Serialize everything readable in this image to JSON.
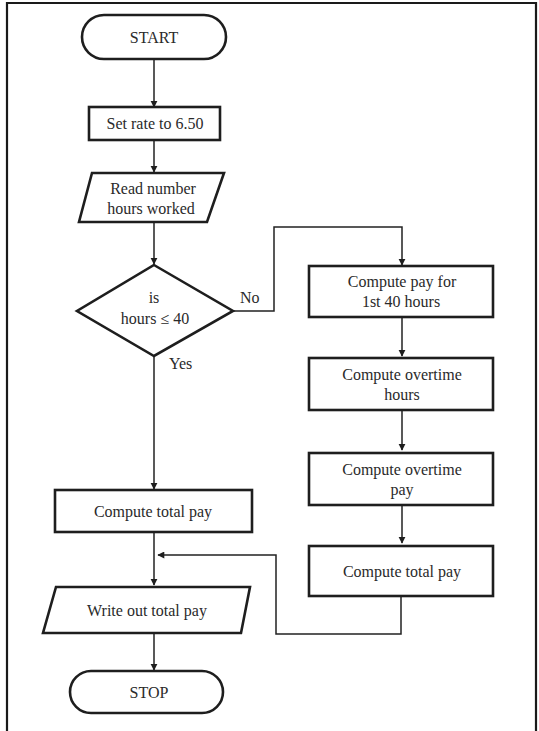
{
  "diagram": {
    "type": "flowchart",
    "colors": {
      "stroke": "#1e1e1e",
      "text": "#2a2a2a",
      "background": "#ffffff"
    },
    "nodes": [
      {
        "id": "start",
        "shape": "terminal",
        "lines": [
          "START"
        ]
      },
      {
        "id": "set_rate",
        "shape": "process",
        "lines": [
          "Set rate to 6.50"
        ]
      },
      {
        "id": "read_hours",
        "shape": "input-output",
        "lines": [
          "Read number",
          "hours worked"
        ]
      },
      {
        "id": "decision",
        "shape": "decision",
        "lines": [
          "is",
          "hours ≤ 40"
        ]
      },
      {
        "id": "pay_first40",
        "shape": "process",
        "lines": [
          "Compute pay for",
          "1st 40 hours"
        ]
      },
      {
        "id": "overtime_hours",
        "shape": "process",
        "lines": [
          "Compute overtime",
          "hours"
        ]
      },
      {
        "id": "overtime_pay",
        "shape": "process",
        "lines": [
          "Compute overtime",
          "pay"
        ]
      },
      {
        "id": "total_pay_right",
        "shape": "process",
        "lines": [
          "Compute total pay"
        ]
      },
      {
        "id": "total_pay_left",
        "shape": "process",
        "lines": [
          "Compute total pay"
        ]
      },
      {
        "id": "write_out",
        "shape": "input-output",
        "lines": [
          "Write out total pay"
        ]
      },
      {
        "id": "stop",
        "shape": "terminal",
        "lines": [
          "STOP"
        ]
      }
    ],
    "edge_labels": {
      "no": "No",
      "yes": "Yes"
    },
    "edges": [
      {
        "from": "start",
        "to": "set_rate"
      },
      {
        "from": "set_rate",
        "to": "read_hours"
      },
      {
        "from": "read_hours",
        "to": "decision"
      },
      {
        "from": "decision",
        "to": "pay_first40",
        "label": "No"
      },
      {
        "from": "decision",
        "to": "total_pay_left",
        "label": "Yes"
      },
      {
        "from": "pay_first40",
        "to": "overtime_hours"
      },
      {
        "from": "overtime_hours",
        "to": "overtime_pay"
      },
      {
        "from": "overtime_pay",
        "to": "total_pay_right"
      },
      {
        "from": "total_pay_right",
        "to": "write_out"
      },
      {
        "from": "total_pay_left",
        "to": "write_out"
      },
      {
        "from": "write_out",
        "to": "stop"
      }
    ]
  }
}
